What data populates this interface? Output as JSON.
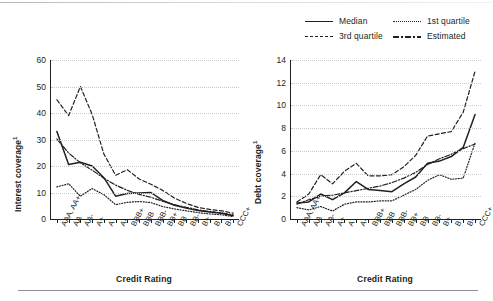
{
  "legend": {
    "items": [
      {
        "label": "Median",
        "style": "solid",
        "name": "legend-median"
      },
      {
        "label": "1st quartile",
        "style": "dotted",
        "name": "legend-1st-quartile"
      },
      {
        "label": "3rd quartile",
        "style": "dashed",
        "name": "legend-3rd-quartile"
      },
      {
        "label": "Estimated",
        "style": "dashdot",
        "name": "legend-estimated"
      }
    ]
  },
  "chart_data": [
    {
      "type": "line",
      "panel": "left",
      "title": "",
      "xlabel": "Credit Rating",
      "ylabel": "Interest coverage",
      "ylabel_superscript": "1",
      "ylim": [
        0,
        60
      ],
      "yticks": [
        0,
        10,
        20,
        30,
        40,
        50,
        60
      ],
      "grid": true,
      "legend_position": "top-right",
      "categories": [
        "AAA, AA+",
        "AA",
        "AA-",
        "A+",
        "A",
        "A-",
        "BBB+",
        "BBB",
        "BBB-",
        "BB+",
        "BB",
        "BB-",
        "B+",
        "B",
        "B-",
        "CCC+"
      ],
      "series": [
        {
          "name": "Median",
          "style": "solid",
          "values": [
            33.0,
            20.6,
            21.4,
            20.0,
            15.6,
            8.6,
            9.6,
            9.8,
            10.0,
            7.0,
            5.2,
            4.1,
            3.2,
            2.6,
            2.2,
            1.2
          ]
        },
        {
          "name": "1st quartile",
          "style": "dotted",
          "values": [
            12.1,
            13.3,
            8.6,
            11.5,
            9.2,
            5.4,
            6.3,
            6.6,
            6.2,
            4.7,
            3.8,
            3.1,
            2.4,
            1.9,
            1.6,
            0.9
          ]
        },
        {
          "name": "3rd quartile",
          "style": "dashed",
          "values": [
            45.0,
            39.0,
            50.0,
            39.5,
            24.5,
            16.5,
            18.6,
            15.1,
            13.1,
            10.8,
            7.9,
            5.9,
            4.4,
            3.6,
            3.1,
            2.2
          ]
        },
        {
          "name": "Estimated",
          "style": "dashdot",
          "values": [
            30.2,
            24.9,
            21.2,
            18.4,
            15.4,
            12.8,
            10.8,
            9.3,
            8.2,
            6.7,
            5.4,
            4.4,
            3.5,
            2.8,
            2.3,
            1.6
          ]
        }
      ]
    },
    {
      "type": "line",
      "panel": "right",
      "title": "",
      "xlabel": "Credit Rating",
      "ylabel": "Debt coverage",
      "ylabel_superscript": "1",
      "ylim": [
        0,
        14
      ],
      "yticks": [
        0,
        2,
        4,
        6,
        8,
        10,
        12,
        14
      ],
      "grid": true,
      "legend_position": "top-right",
      "categories": [
        "AAA, AA+",
        "AA",
        "AA-",
        "A+",
        "A",
        "A-",
        "BBB+",
        "BBB",
        "BBB-",
        "BB+",
        "BB",
        "BB-",
        "B+",
        "B",
        "B-",
        "CCC+"
      ],
      "series": [
        {
          "name": "Median",
          "style": "solid",
          "values": [
            1.4,
            1.5,
            2.2,
            1.7,
            2.3,
            3.3,
            2.6,
            2.5,
            2.4,
            3.1,
            3.7,
            4.9,
            5.1,
            5.5,
            6.3,
            9.2
          ]
        },
        {
          "name": "1st quartile",
          "style": "dotted",
          "values": [
            1.0,
            0.8,
            1.1,
            0.7,
            1.3,
            1.5,
            1.5,
            1.6,
            1.6,
            2.1,
            2.6,
            3.4,
            3.9,
            3.5,
            3.6,
            6.7
          ]
        },
        {
          "name": "3rd quartile",
          "style": "dashed",
          "values": [
            1.5,
            2.2,
            3.9,
            3.1,
            4.2,
            4.9,
            3.8,
            3.8,
            3.9,
            4.6,
            5.6,
            7.3,
            7.5,
            7.7,
            9.4,
            13.0
          ]
        },
        {
          "name": "Estimated",
          "style": "dashdot",
          "values": [
            1.3,
            1.7,
            2.0,
            2.1,
            2.3,
            2.5,
            2.7,
            2.9,
            3.2,
            3.6,
            4.1,
            4.8,
            5.3,
            5.7,
            6.2,
            6.6
          ]
        }
      ]
    }
  ]
}
